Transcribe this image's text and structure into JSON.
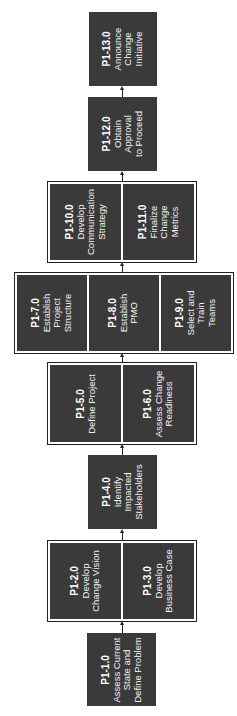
{
  "diagram": {
    "orientation": "rotated-90-ccw, flow bottom-to-top",
    "nodes": [
      {
        "id": "P1-1.0",
        "lines": [
          "Assess Current",
          "State and",
          "Define Problem"
        ]
      },
      {
        "id": "P1-2.0",
        "lines": [
          "Develop",
          "Change Vision"
        ]
      },
      {
        "id": "P1-3.0",
        "lines": [
          "Develop",
          "Business Case"
        ]
      },
      {
        "id": "P1-4.0",
        "lines": [
          "Identify",
          "Impacted",
          "Stakeholders"
        ]
      },
      {
        "id": "P1-5.0",
        "lines": [
          "Define Project"
        ]
      },
      {
        "id": "P1-6.0",
        "lines": [
          "Assess Change",
          "Readiness"
        ]
      },
      {
        "id": "P1-7.0",
        "lines": [
          "Establish",
          "Project",
          "Structure"
        ]
      },
      {
        "id": "P1-8.0",
        "lines": [
          "Establish",
          "PMO"
        ]
      },
      {
        "id": "P1-9.0",
        "lines": [
          "Select and",
          "Train",
          "Teams"
        ]
      },
      {
        "id": "P1-10.0",
        "lines": [
          "Develop",
          "Communication",
          "Strategy"
        ]
      },
      {
        "id": "P1-11.0",
        "lines": [
          "Finalize",
          "Change",
          "Metrics"
        ]
      },
      {
        "id": "P1-12.0",
        "lines": [
          "Obtain",
          "Approval",
          "to Proceed"
        ]
      },
      {
        "id": "P1-13.0",
        "lines": [
          "Announce",
          "Change",
          "Initiative"
        ]
      }
    ],
    "groups": [
      {
        "members": [
          "P1-2.0",
          "P1-3.0"
        ]
      },
      {
        "members": [
          "P1-5.0",
          "P1-6.0"
        ]
      },
      {
        "members": [
          "P1-7.0",
          "P1-8.0",
          "P1-9.0"
        ]
      },
      {
        "members": [
          "P1-10.0",
          "P1-11.0"
        ]
      }
    ],
    "edges": [
      [
        "P1-1.0",
        "group-2-3"
      ],
      [
        "group-2-3",
        "P1-4.0"
      ],
      [
        "P1-4.0",
        "group-5-6"
      ],
      [
        "group-5-6",
        "group-7-9"
      ],
      [
        "group-7-9",
        "group-10-11"
      ],
      [
        "group-10-11",
        "P1-12.0"
      ],
      [
        "P1-12.0",
        "P1-13.0"
      ]
    ],
    "colors": {
      "node_fill": "#3a3a3a",
      "node_text": "#f2f2f2",
      "group_border": "#222222",
      "background": "#ffffff"
    }
  }
}
